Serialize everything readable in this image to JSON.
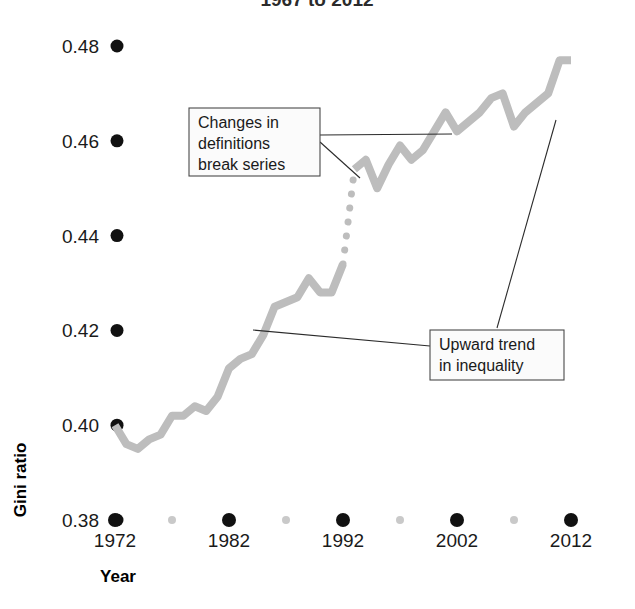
{
  "chart_data": {
    "type": "line",
    "title": "1967 to 2012",
    "xlabel": "Year",
    "ylabel": "Gini ratio",
    "xlim": [
      1970,
      2013
    ],
    "ylim": [
      0.38,
      0.485
    ],
    "grid": false,
    "legend": "none",
    "y_ticks": [
      0.38,
      0.4,
      0.42,
      0.44,
      0.46,
      0.48
    ],
    "y_tick_labels": [
      "0.38",
      "0.40",
      "0.42",
      "0.44",
      "0.46",
      "0.48"
    ],
    "x_ticks": [
      1972,
      1982,
      1992,
      2002,
      2012
    ],
    "x_tick_labels": [
      "1972",
      "1982",
      "1992",
      "2002",
      "2012"
    ],
    "x_minor_ticks": [
      1977,
      1987,
      1997,
      2007
    ],
    "line_color": "#bdbdbd",
    "tick_color": "#111111",
    "minor_tick_color": "#c9c9c9",
    "series": [
      {
        "name": "Gini ratio (old definitions)",
        "style": "solid",
        "x": [
          1972,
          1973,
          1974,
          1975,
          1976,
          1977,
          1978,
          1979,
          1980,
          1981,
          1982,
          1983,
          1984,
          1985,
          1986,
          1987,
          1988,
          1989,
          1990,
          1991,
          1992
        ],
        "values": [
          0.4,
          0.396,
          0.395,
          0.397,
          0.398,
          0.402,
          0.402,
          0.404,
          0.403,
          0.406,
          0.412,
          0.414,
          0.415,
          0.419,
          0.425,
          0.426,
          0.427,
          0.431,
          0.428,
          0.428,
          0.434
        ]
      },
      {
        "name": "Series break (changed definitions)",
        "style": "dotted",
        "x": [
          1992,
          1993
        ],
        "values": [
          0.434,
          0.454
        ]
      },
      {
        "name": "Gini ratio (new definitions)",
        "style": "solid",
        "x": [
          1993,
          1994,
          1995,
          1996,
          1997,
          1998,
          1999,
          2000,
          2001,
          2002,
          2003,
          2004,
          2005,
          2006,
          2007,
          2008,
          2009,
          2010,
          2011,
          2012
        ],
        "values": [
          0.454,
          0.456,
          0.45,
          0.455,
          0.459,
          0.456,
          0.458,
          0.462,
          0.466,
          0.462,
          0.464,
          0.466,
          0.469,
          0.47,
          0.463,
          0.466,
          0.468,
          0.47,
          0.477,
          0.477
        ]
      }
    ],
    "annotations": [
      {
        "id": "series-break-note",
        "lines": [
          "Changes in",
          "definitions",
          "break series"
        ],
        "box": {
          "x": 189,
          "y": 108,
          "width": 131,
          "height": 68
        }
      },
      {
        "id": "upward-trend-note",
        "lines": [
          "Upward trend",
          "in inequality"
        ],
        "box": {
          "x": 430,
          "y": 330,
          "width": 134,
          "height": 50
        }
      }
    ]
  }
}
